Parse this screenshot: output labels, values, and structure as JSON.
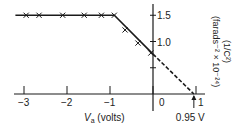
{
  "chart_data": {
    "type": "line",
    "title": "",
    "xlabel": "V_a (volts)",
    "xlabel_main": "V",
    "xlabel_sub": "a",
    "xlabel_rest": " (volts)",
    "ylabel_line1": "(1/C²)",
    "ylabel_line2": "(farads⁻² × 10⁻²⁴)",
    "xlim": [
      -3.2,
      1.1
    ],
    "ylim": [
      0,
      1.65
    ],
    "x_ticks": [
      -3,
      -2,
      -1,
      0,
      1
    ],
    "x_tick_labels": [
      "−3",
      "−2",
      "−1",
      "0",
      "1"
    ],
    "y_ticks": [
      0.5,
      1.0,
      1.5
    ],
    "y_tick_labels": [
      "",
      "1.0",
      "1.5"
    ],
    "grid": false,
    "series": [
      {
        "name": "measured",
        "marker": "x",
        "x": [
          -2.95,
          -2.65,
          -2.1,
          -1.6,
          -1.2,
          -0.9,
          -0.65,
          -0.35,
          -0.05
        ],
        "y": [
          1.5,
          1.5,
          1.5,
          1.5,
          1.5,
          1.5,
          1.22,
          0.97,
          0.78
        ]
      },
      {
        "name": "fit-solid",
        "style": "solid",
        "x": [
          -3.2,
          -0.9,
          0.0
        ],
        "y": [
          1.5,
          1.5,
          0.76
        ]
      },
      {
        "name": "fit-extrapolated",
        "style": "dashed",
        "x": [
          0.0,
          0.95
        ],
        "y": [
          0.76,
          0.0
        ]
      }
    ],
    "annotations": [
      {
        "text": "0.95 V",
        "x": 0.95,
        "y": 0,
        "arrow": true
      }
    ]
  }
}
